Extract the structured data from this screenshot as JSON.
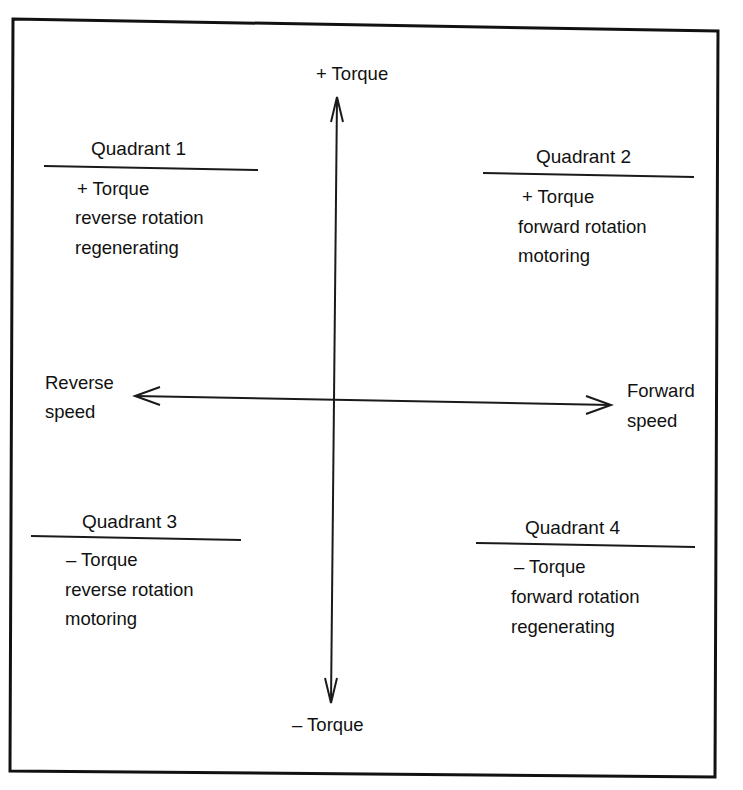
{
  "diagram": {
    "type": "four-quadrant motor operation diagram",
    "axes": {
      "vertical": {
        "top_label": "+ Torque",
        "bottom_label": "–  Torque"
      },
      "horizontal": {
        "left_label_line1": "Reverse",
        "left_label_line2": "speed",
        "right_label_line1": "Forward",
        "right_label_line2": "speed"
      }
    },
    "quadrants": [
      {
        "title": "Quadrant 1",
        "torque": "+  Torque",
        "rotation": "reverse rotation",
        "mode": "regenerating"
      },
      {
        "title": "Quadrant 2",
        "torque": "+  Torque",
        "rotation": "forward rotation",
        "mode": "motoring"
      },
      {
        "title": "Quadrant 3",
        "torque": "–  Torque",
        "rotation": "reverse rotation",
        "mode": "motoring"
      },
      {
        "title": "Quadrant 4",
        "torque": "–  Torque",
        "rotation": "forward rotation",
        "mode": "regenerating"
      }
    ],
    "colors": {
      "ink": "#111111",
      "background": "#ffffff"
    }
  }
}
